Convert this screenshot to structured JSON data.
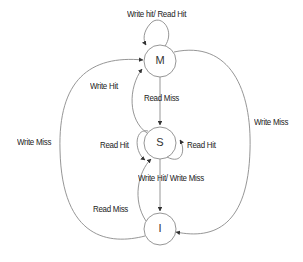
{
  "diagram": {
    "type": "state-machine",
    "states": [
      {
        "id": "M",
        "label": "M"
      },
      {
        "id": "S",
        "label": "S"
      },
      {
        "id": "I",
        "label": "I"
      }
    ],
    "transitions": [
      {
        "from": "M",
        "to": "M",
        "label": "Write hit/ Read Hit"
      },
      {
        "from": "S",
        "to": "M",
        "label": "Write Hit"
      },
      {
        "from": "M",
        "to": "S",
        "label": "Read Miss"
      },
      {
        "from": "I",
        "to": "M",
        "label": "Write Miss"
      },
      {
        "from": "M",
        "to": "I",
        "label": "Write Miss"
      },
      {
        "from": "S",
        "to": "S",
        "label": "Read Hit",
        "side": "left"
      },
      {
        "from": "S",
        "to": "S",
        "label": "Read Hit",
        "side": "right"
      },
      {
        "from": "S",
        "to": "I",
        "label": "Write Hit/ Write Miss"
      },
      {
        "from": "I",
        "to": "S",
        "label": "Read Miss"
      }
    ]
  },
  "colors": {
    "line": "#8a8a8a",
    "text": "#222222",
    "arrow": "#333333"
  }
}
